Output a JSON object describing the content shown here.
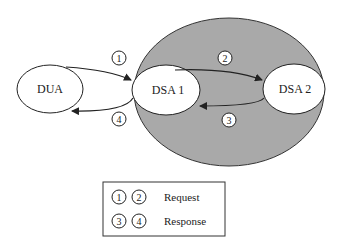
{
  "diagram": {
    "nodes": [
      {
        "id": "dua",
        "label": "DUA"
      },
      {
        "id": "dsa1",
        "label": "DSA 1"
      },
      {
        "id": "dsa2",
        "label": "DSA 2"
      }
    ],
    "edges": [
      {
        "from": "dua",
        "to": "dsa1",
        "step": "1"
      },
      {
        "from": "dsa1",
        "to": "dsa2",
        "step": "2"
      },
      {
        "from": "dsa2",
        "to": "dsa1",
        "step": "3"
      },
      {
        "from": "dsa1",
        "to": "dua",
        "step": "4"
      }
    ],
    "colors": {
      "shaded_region": "#a9a9a9",
      "node_fill": "#ffffff",
      "stroke": "#222222"
    }
  },
  "legend": {
    "rows": [
      {
        "steps": [
          "1",
          "2"
        ],
        "label": "Request"
      },
      {
        "steps": [
          "3",
          "4"
        ],
        "label": "Response"
      }
    ]
  }
}
